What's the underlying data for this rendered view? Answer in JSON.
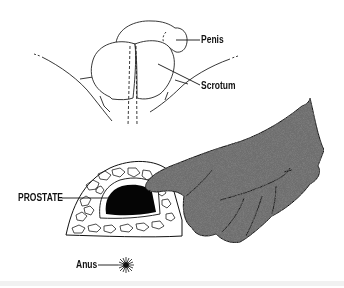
{
  "diagram": {
    "labels": {
      "penis": "Penis",
      "scrotum": "Scrotum",
      "prostate": "PROSTATE",
      "anus": "Anus"
    },
    "colors": {
      "ink": "#111111",
      "glove": "#6e6e6e",
      "prostate": "#050505",
      "background": "#ffffff"
    }
  }
}
